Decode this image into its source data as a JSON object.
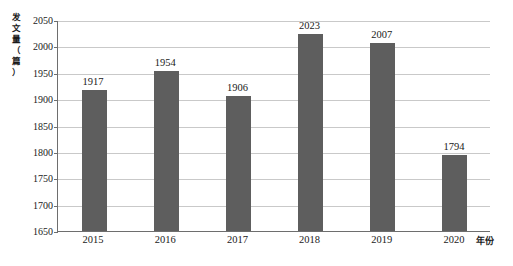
{
  "chart_data": {
    "type": "bar",
    "title": "",
    "subtitle": "",
    "xlabel": "年份",
    "ylabel": "发文量（篇）",
    "categories": [
      "2015",
      "2016",
      "2017",
      "2018",
      "2019",
      "2020"
    ],
    "values": [
      1917,
      1954,
      1906,
      2023,
      2007,
      1794
    ],
    "data_labels": [
      "1917",
      "1954",
      "1906",
      "2023",
      "2007",
      "1794"
    ],
    "ylim": [
      1650,
      2050
    ],
    "ytick_step": 50,
    "ytick_labels": [
      "2050",
      "2000",
      "1950",
      "1900",
      "1850",
      "1800",
      "1750",
      "1700",
      "1650"
    ],
    "ytick_values": [
      2050,
      2000,
      1950,
      1900,
      1850,
      1800,
      1750,
      1700,
      1650
    ],
    "grid": true,
    "grid_axis": "y",
    "legend": false,
    "legend_position": "none",
    "series": [
      {
        "name": "发文量",
        "values": [
          1917,
          1954,
          1906,
          2023,
          2007,
          1794
        ]
      }
    ],
    "colors": {
      "bar": "#5e5e5e",
      "gridline": "#c9c9c9",
      "axis": "#6e6e6e",
      "text": "#1a1a1a",
      "background": "#ffffff"
    }
  },
  "axis": {
    "y_title_chars": "发\n文\n量\n（\n篇\n）",
    "x_title": "年份"
  }
}
